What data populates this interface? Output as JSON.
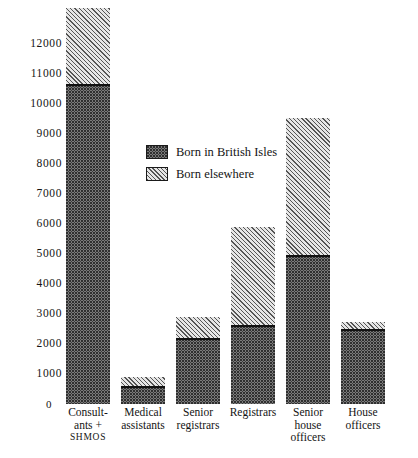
{
  "chart_data": {
    "type": "bar",
    "subtype": "stacked-vertical",
    "title": "",
    "xlabel": "",
    "ylabel": "",
    "ylim": [
      0,
      12000
    ],
    "ytick_step": 1000,
    "grid": false,
    "legend_position": "inside-upper-center",
    "categories": [
      "Consultants + SHMOS",
      "Medical assistants",
      "Senior registrars",
      "Registrars",
      "Senior house officers",
      "House officers"
    ],
    "category_lines": [
      [
        "Consult-",
        "ants +",
        "SHMOS"
      ],
      [
        "Medical",
        "assistants"
      ],
      [
        "Senior",
        "registrars"
      ],
      [
        "Registrars"
      ],
      [
        "Senior",
        "house",
        "officers"
      ],
      [
        "House",
        "officers"
      ]
    ],
    "ytick_labels": [
      "12000",
      "11000",
      "10000",
      "9000",
      "8000",
      "7000",
      "6000",
      "5000",
      "4000",
      "3000",
      "2000",
      "1000",
      "0"
    ],
    "ytick_values": [
      12000,
      11000,
      10000,
      9000,
      8000,
      7000,
      6000,
      5000,
      4000,
      3000,
      2000,
      1000,
      0
    ],
    "series": [
      {
        "name": "Born in British Isles",
        "pattern": "stipple",
        "color": "#8f8f8f",
        "values": [
          10650,
          570,
          2170,
          2600,
          4950,
          2480
        ]
      },
      {
        "name": "Born elsewhere",
        "pattern": "diagonal-hatch",
        "color": "#d4d4d4",
        "values": [
          2550,
          330,
          730,
          3300,
          4600,
          270
        ]
      }
    ],
    "totals": [
      13200,
      900,
      2900,
      5900,
      9550,
      2750
    ]
  },
  "legend": {
    "items": [
      {
        "label": "Born in British Isles",
        "pattern": "stipple"
      },
      {
        "label": "Born elsewhere",
        "pattern": "diagonal-hatch"
      }
    ]
  },
  "axis": {
    "origin_label": "0"
  }
}
